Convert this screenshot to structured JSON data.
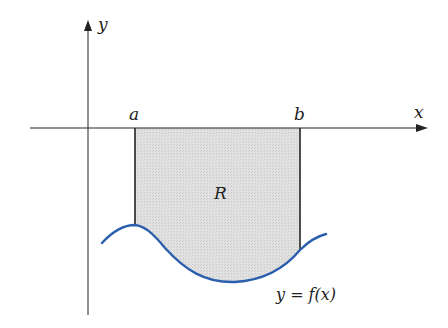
{
  "diagram": {
    "labels": {
      "y_axis": "y",
      "x_axis": "x",
      "a": "a",
      "b": "b",
      "region": "R",
      "curve": "y = f(x)"
    },
    "colors": {
      "axis": "#222222",
      "curve": "#2b5fae",
      "region_fill": "#dcdcdc",
      "bound_lines": "#222222"
    }
  }
}
